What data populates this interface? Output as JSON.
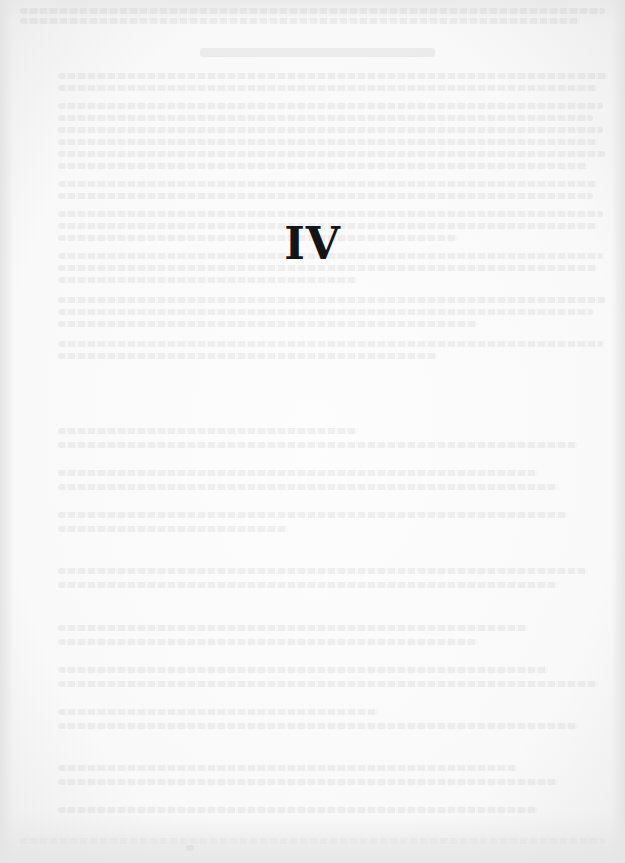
{
  "page": {
    "chapter_number": "IV",
    "background_color": "#f9f9f9",
    "text_color": "#141414"
  }
}
